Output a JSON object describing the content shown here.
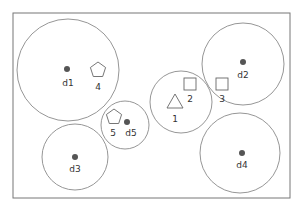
{
  "canvas": {
    "width": 307,
    "height": 209,
    "background": "#ffffff"
  },
  "frame": {
    "x": 13,
    "y": 13,
    "width": 277,
    "height": 185,
    "stroke": "#777777"
  },
  "colors": {
    "circle_stroke": "#8a8a8a",
    "dot_fill": "#555555",
    "shape_stroke": "#666666",
    "text": "#333333"
  },
  "circles": [
    {
      "id": "d1",
      "cx": 68,
      "cy": 70,
      "r": 51
    },
    {
      "id": "d2",
      "cx": 243,
      "cy": 64,
      "r": 41
    },
    {
      "id": "c1",
      "cx": 181,
      "cy": 102,
      "r": 31
    },
    {
      "id": "d5",
      "cx": 125,
      "cy": 125,
      "r": 24
    },
    {
      "id": "d3",
      "cx": 75,
      "cy": 157,
      "r": 33
    },
    {
      "id": "d4",
      "cx": 240,
      "cy": 153,
      "r": 40
    }
  ],
  "depots": [
    {
      "label": "d1",
      "x": 67,
      "y": 69,
      "label_x": 68,
      "label_y": 86
    },
    {
      "label": "d2",
      "x": 243,
      "y": 62,
      "label_x": 243,
      "label_y": 78
    },
    {
      "label": "d3",
      "x": 75,
      "y": 157,
      "label_x": 75,
      "label_y": 172
    },
    {
      "label": "d4",
      "x": 242,
      "y": 153,
      "label_x": 242,
      "label_y": 168
    },
    {
      "label": "d5",
      "x": 127,
      "y": 122,
      "label_x": 131,
      "label_y": 136
    }
  ],
  "nodes": [
    {
      "label": "1",
      "shape": "triangle",
      "x": 175,
      "y": 102,
      "label_x": 175,
      "label_y": 122
    },
    {
      "label": "2",
      "shape": "square",
      "x": 190,
      "y": 84,
      "label_x": 190,
      "label_y": 102
    },
    {
      "label": "3",
      "shape": "square",
      "x": 222,
      "y": 84,
      "label_x": 222,
      "label_y": 102
    },
    {
      "label": "4",
      "shape": "pentagon",
      "x": 98,
      "y": 70,
      "label_x": 98,
      "label_y": 90
    },
    {
      "label": "5",
      "shape": "pentagon",
      "x": 114,
      "y": 117,
      "label_x": 113,
      "label_y": 136
    }
  ]
}
